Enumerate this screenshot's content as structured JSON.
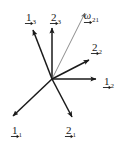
{
  "figure": {
    "kind": "vector-diagram",
    "title": "",
    "width": 128,
    "height": 144,
    "background_color": "#ffffff",
    "stroke_color": "#1a1a1a",
    "thin_stroke_color": "#6e6e6e",
    "origin": {
      "x": 52,
      "y": 79
    }
  },
  "chart_data": {
    "type": "scatter",
    "title": "",
    "xlabel": "",
    "ylabel": "",
    "origin": {
      "x": 52,
      "y": 79
    },
    "vectors": [
      {
        "id": "e1_3",
        "base": "1",
        "subscript": "3",
        "has_overarrow": true,
        "tip": {
          "x": 33,
          "y": 30
        },
        "thin": false,
        "label_pos": {
          "x": 26,
          "y": 8
        }
      },
      {
        "id": "e2_3",
        "base": "2",
        "subscript": "3",
        "has_overarrow": true,
        "tip": {
          "x": 52,
          "y": 28
        },
        "thin": false,
        "label_pos": {
          "x": 51,
          "y": 8
        }
      },
      {
        "id": "omega_21",
        "base": "ω",
        "subscript": "21",
        "has_overarrow": true,
        "tip": {
          "x": 85,
          "y": 13
        },
        "thin": true,
        "label_pos": {
          "x": 84,
          "y": 6
        }
      },
      {
        "id": "e2_2",
        "base": "2",
        "subscript": "2",
        "has_overarrow": true,
        "tip": {
          "x": 89,
          "y": 60
        },
        "thin": false,
        "label_pos": {
          "x": 92,
          "y": 38
        }
      },
      {
        "id": "e1_2",
        "base": "1",
        "subscript": "2",
        "has_overarrow": true,
        "tip": {
          "x": 96,
          "y": 79
        },
        "thin": false,
        "label_pos": {
          "x": 104,
          "y": 73
        }
      },
      {
        "id": "e1_1",
        "base": "1",
        "subscript": "1",
        "has_overarrow": true,
        "tip": {
          "x": 13,
          "y": 116
        },
        "thin": false,
        "label_pos": {
          "x": 12,
          "y": 122
        }
      },
      {
        "id": "e2_1",
        "base": "2",
        "subscript": "1",
        "has_overarrow": true,
        "tip": {
          "x": 72,
          "y": 117
        },
        "thin": false,
        "label_pos": {
          "x": 66,
          "y": 122
        }
      }
    ],
    "legend_position": "none",
    "grid": false
  }
}
